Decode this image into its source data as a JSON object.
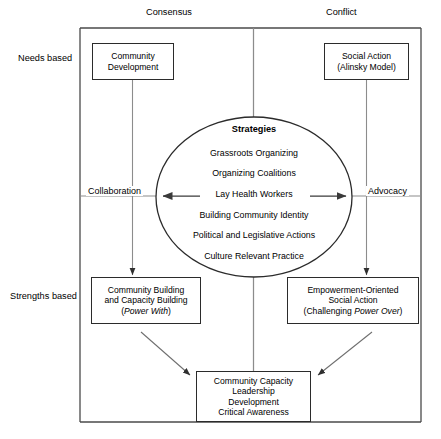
{
  "diagram": {
    "title_axes": {
      "top_left": "Consensus",
      "top_right": "Conflict",
      "left_upper": "Needs based",
      "left_lower": "Strengths based",
      "mid_left": "Collaboration",
      "mid_right": "Advocacy"
    },
    "boxes": {
      "community_development": [
        "Community",
        "Development"
      ],
      "social_action": [
        "Social Action",
        "(Alinsky Model)"
      ],
      "community_building": {
        "line1": "Community Building",
        "line2": "and Capacity Building",
        "line3_prefix": "(",
        "line3_italic": "Power With",
        "line3_suffix": ")"
      },
      "empowerment": {
        "line1": "Empowerment-Oriented",
        "line2": "Social Action",
        "line3_prefix": "(Challenging ",
        "line3_italic": "Power Over",
        "line3_suffix": ")"
      },
      "outcomes": [
        "Community Capacity",
        "Leadership",
        "Development",
        "Critical Awareness"
      ]
    },
    "circle": {
      "title": "Strategies",
      "items": [
        "Grassroots Organizing",
        "Organizing Coalitions",
        "Lay Health Workers",
        "Building Community Identity",
        "Political and Legislative Actions",
        "Culture Relevant Practice"
      ]
    },
    "colors": {
      "frame": "#4a4a4a",
      "box_border": "#2b2b2b",
      "connector": "#8c8c8c",
      "arrow": "#3a3a3a",
      "text": "#000000"
    }
  }
}
